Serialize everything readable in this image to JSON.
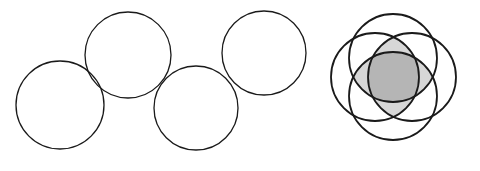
{
  "figure": {
    "background_color": "#ffffff",
    "stroke_color": "#1a1a1a",
    "canvas": {
      "width": 480,
      "height": 171
    }
  },
  "chart_data": {
    "type": "diagram",
    "subtitle": "Left: four separate tangent circles in a zigzag chain. Right: four mutually overlapping circles forming a shaded rosette.",
    "xlabel": "",
    "ylabel": "",
    "xlim": [
      0,
      480
    ],
    "ylim": [
      0,
      171
    ],
    "grid": false,
    "legend": "none",
    "groups": [
      {
        "name": "left-group",
        "label": "Chain of four non-overlapping circles",
        "shaded": false,
        "stroke_width": 1.3,
        "circles": [
          {
            "id": "left-circle-1",
            "cx": 60,
            "cy": 105,
            "r": 44
          },
          {
            "id": "left-circle-2",
            "cx": 128,
            "cy": 55,
            "r": 43
          },
          {
            "id": "left-circle-3",
            "cx": 196,
            "cy": 108,
            "r": 42
          },
          {
            "id": "left-circle-4",
            "cx": 264,
            "cy": 53,
            "r": 42
          }
        ]
      },
      {
        "name": "right-group",
        "label": "Rosette of four overlapping circles with shaded lenses",
        "shaded": true,
        "stroke_width": 1.8,
        "circles": [
          {
            "id": "right-circle-top",
            "cx": 393,
            "cy": 58,
            "r": 44
          },
          {
            "id": "right-circle-bottom",
            "cx": 393,
            "cy": 96,
            "r": 44
          },
          {
            "id": "right-circle-left",
            "cx": 375,
            "cy": 77,
            "r": 44
          },
          {
            "id": "right-circle-right",
            "cx": 412,
            "cy": 77,
            "r": 44
          }
        ],
        "shading": [
          {
            "id": "vertical-lens",
            "description": "Intersection of the top and bottom circles",
            "color": "#d7d7d7"
          },
          {
            "id": "horizontal-lens",
            "description": "Intersection of the left and right circles",
            "color": "#d7d7d7"
          },
          {
            "id": "center-region",
            "description": "Region common to all four circles",
            "color": "#b5b5b5"
          }
        ]
      }
    ],
    "counts": {
      "left_group_circles": 4,
      "right_group_circles": 4,
      "total_circles": 8
    }
  }
}
